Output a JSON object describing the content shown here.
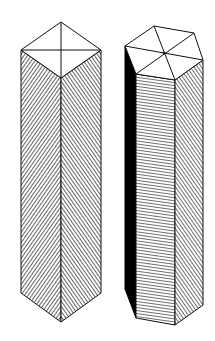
{
  "figure": {
    "colors": {
      "stroke": "#111111",
      "hatch": "#222222",
      "shadow": "#000000",
      "top": "#ffffff",
      "background": "#ffffff"
    }
  },
  "prisms": [
    {
      "name": "square-prism",
      "top": {
        "back": [
          61,
          22
        ],
        "left": [
          21,
          50
        ],
        "right": [
          101,
          50
        ],
        "front": [
          61,
          78
        ]
      },
      "bottom": {
        "left": [
          21,
          293
        ],
        "front": [
          61,
          322
        ],
        "right": [
          101,
          293
        ]
      }
    },
    {
      "name": "hexagonal-prism",
      "top": {
        "back": [
          154,
          26
        ],
        "back_right": [
          194,
          33
        ],
        "right": [
          203,
          60
        ],
        "front_right": [
          175,
          80
        ],
        "front_left": [
          136,
          74
        ],
        "left": [
          125,
          46
        ],
        "center": [
          164,
          53
        ]
      },
      "bottom": {
        "left": [
          125,
          289
        ],
        "front_left": [
          136,
          318
        ],
        "front_right": [
          175,
          325
        ],
        "right": [
          203,
          305
        ]
      }
    }
  ]
}
